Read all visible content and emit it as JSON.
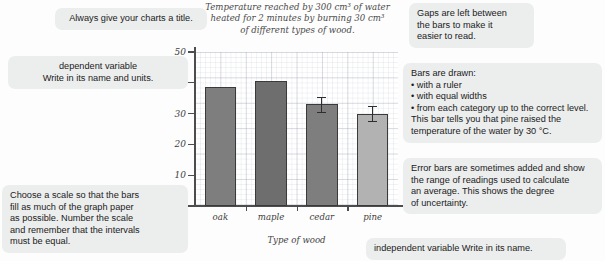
{
  "chart_data": {
    "type": "bar",
    "title": "Temperature reached by 300 cm³ of water heated for 2 minutes by burning 30 cm³ of different types of wood.",
    "title_lines": [
      "Temperature reached by 300 cm³ of water",
      "heated for 2 minutes by burning 30 cm³",
      "of different types of wood."
    ],
    "xlabel": "Type of wood",
    "ylabel": "Temperature increase of water (°C)",
    "categories": [
      "oak",
      "maple",
      "cedar",
      "pine"
    ],
    "values": [
      38.5,
      40.5,
      33.0,
      30.0
    ],
    "errors": [
      null,
      null,
      2.5,
      2.5
    ],
    "bar_colors": [
      "#7e7e7e",
      "#6e6e6e",
      "#7e7e7e",
      "#b2b2b2"
    ],
    "ylim": [
      0,
      50
    ],
    "yticks": [
      0,
      10,
      20,
      30,
      40,
      50
    ],
    "ytick_labels": [
      "0",
      "10",
      "20",
      "30",
      "40",
      "50"
    ],
    "grid": true,
    "legend": "none"
  },
  "annotations": {
    "title_advice": {
      "lines": [
        "Always give your charts a title."
      ]
    },
    "dependent": {
      "lines": [
        "dependent variable",
        "Write in its name and units."
      ]
    },
    "scale": {
      "lines": [
        "Choose a scale so that the bars",
        "fill as much of the graph paper",
        "as possible. Number the scale",
        "and remember that the intervals",
        "must be equal."
      ]
    },
    "gaps": {
      "lines": [
        "Gaps are left between",
        "the bars to make it",
        "easier to read."
      ]
    },
    "bars": {
      "lines": [
        "Bars are drawn:",
        "• with a ruler",
        "• with equal widths",
        "• from each category up to the correct level.",
        "This bar tells you that pine raised the",
        "temperature of the water by 30 °C."
      ]
    },
    "error": {
      "lines": [
        "Error bars are sometimes added and show",
        "the range of readings used to calculate",
        "an average. This shows the degree",
        "of uncertainty."
      ]
    },
    "independent": {
      "lines": [
        "independent variable    Write in its name."
      ]
    }
  }
}
